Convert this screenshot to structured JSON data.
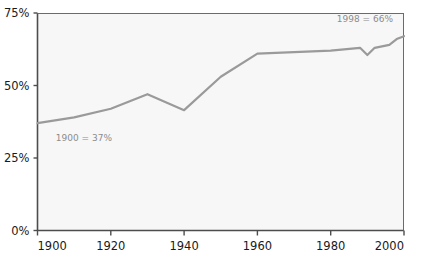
{
  "chart_data": {
    "type": "line",
    "title": "",
    "subtitle": "",
    "xlabel": "",
    "ylabel": "",
    "xlim": [
      1900,
      2000
    ],
    "ylim": [
      0,
      75
    ],
    "grid": false,
    "legend": null,
    "x_ticks": [
      "1900",
      "1920",
      "1940",
      "1960",
      "1980",
      "2000"
    ],
    "x_tick_values": [
      1900,
      1920,
      1940,
      1960,
      1980,
      2000
    ],
    "y_ticks": [
      "0%",
      "25%",
      "50%",
      "75%"
    ],
    "y_tick_values": [
      0,
      25,
      50,
      75
    ],
    "series": [
      {
        "name": "value",
        "color": "#9a9a9a",
        "x": [
          1900,
          1910,
          1920,
          1930,
          1940,
          1950,
          1960,
          1970,
          1980,
          1988,
          1990,
          1992,
          1994,
          1996,
          1998,
          2000
        ],
        "values": [
          37,
          39,
          42,
          47,
          41.5,
          53,
          61,
          61.5,
          62,
          63,
          60.5,
          63,
          63.5,
          64,
          66,
          67
        ]
      }
    ],
    "annotations": [
      {
        "name": "start-annotation",
        "text": "1900 = 37%",
        "x": 1905,
        "y": 31,
        "anchor": "start",
        "color": "#8c8c8c"
      },
      {
        "name": "end-annotation",
        "text": "1998 = 66%",
        "x": 1997,
        "y": 72,
        "anchor": "end",
        "color": "#8c8c8c"
      }
    ],
    "colors": {
      "line": "#9a9a9a",
      "plot_background": "#f7f7f7",
      "axis": "#4d4d4d",
      "tick_text": "#1a1a1a",
      "annotation_text": "#8c8c8c",
      "page_background": "#ffffff"
    }
  }
}
